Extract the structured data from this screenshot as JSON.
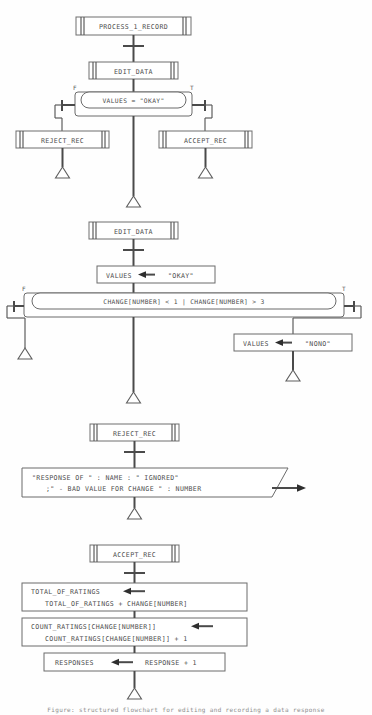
{
  "diagram": {
    "type": "structured-flowchart",
    "caption": "Figure: structured flowchart for editing and recording a data response",
    "colors": {
      "background": "#fefefe",
      "line": "#575757",
      "box_stroke": "#6b6b6b",
      "text": "#4d4d4d",
      "arrowhead": "#2e2e2e"
    }
  },
  "sections": [
    {
      "id": "process_1_record",
      "header": "PROCESS_1_RECORD",
      "call_box": "EDIT_DATA",
      "condition": "VALUES = \"OKAY\"",
      "false_label": "F",
      "true_label": "T",
      "false_branch": "REJECT_REC",
      "true_branch": "ACCEPT_REC"
    },
    {
      "id": "edit_data",
      "header": "EDIT_DATA",
      "assign_left": "VALUES",
      "assign_right": "\"OKAY\"",
      "condition": "CHANGE[NUMBER] < 1 | CHANGE[NUMBER] > 3",
      "false_label": "F",
      "true_label": "T",
      "true_assign_left": "VALUES",
      "true_assign_right": "\"NONO\""
    },
    {
      "id": "reject_rec",
      "header": "REJECT_REC",
      "output_line_1": "\"RESPONSE OF \" : NAME : \" IGNORED\"",
      "output_line_2": ";\" - BAD VALUE FOR CHANGE \" : NUMBER"
    },
    {
      "id": "accept_rec",
      "header": "ACCEPT_REC",
      "statements": [
        {
          "target": "TOTAL_OF_RATINGS",
          "expression": "TOTAL_OF_RATINGS + CHANGE[NUMBER]",
          "lines": 2
        },
        {
          "target": "COUNT_RATINGS[CHANGE[NUMBER]]",
          "expression": "COUNT_RATINGS[CHANGE[NUMBER]] + 1",
          "lines": 2
        },
        {
          "target": "RESPONSES",
          "expression": "RESPONSE + 1",
          "lines": 1
        }
      ]
    }
  ],
  "symbols": {
    "assign_arrow": "left-arrow",
    "terminator": "triangle",
    "output_shape": "parallelogram"
  }
}
